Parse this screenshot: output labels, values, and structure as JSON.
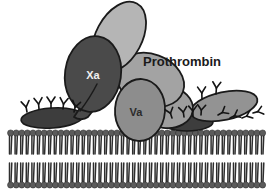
{
  "figure": {
    "background_color": "#ffffff",
    "width": 271,
    "height": 192
  },
  "labels": {
    "prothrombin": "Prothrombin",
    "factor_xa": "Xa",
    "factor_va": "Va"
  },
  "label_styles": {
    "prothrombin": {
      "color": "#1a1a1a",
      "font_size": 13,
      "x": 143,
      "y": 63
    },
    "factor_xa": {
      "color": "#f0f0f0",
      "font_size": 11,
      "x": 93,
      "y": 76
    },
    "factor_va": {
      "color": "#2b2b2b",
      "font_size": 11,
      "x": 136,
      "y": 113
    }
  },
  "colors": {
    "outline": "#1a1a1a",
    "factor_xa_fill": "#4a4a4a",
    "factor_va_fill": "#8d8d8d",
    "prothrombin_fill": "#9e9e9e",
    "prothrombin_top_fill": "#b5b5b5",
    "membrane_anchor_fill": "#3d3d3d",
    "right_protein_fill": "#939393",
    "lipid_head_fill": "#5b5b5b",
    "lipid_tail_stroke": "#2e2e2e",
    "gla_stroke": "#1a1a1a"
  },
  "shapes": {
    "prothrombin_top_lobe": {
      "cx": 118,
      "cy": 36,
      "rx": 23,
      "ry": 37,
      "rotate": 28
    },
    "prothrombin_mid_lobe": {
      "cx": 150,
      "cy": 82,
      "rx": 34,
      "ry": 26,
      "rotate": 22
    },
    "prothrombin_lower_lobe": {
      "cx": 165,
      "cy": 106,
      "rx": 26,
      "ry": 21,
      "rotate": 10
    },
    "factor_xa_body": {
      "cx": 93,
      "cy": 75,
      "rx": 28,
      "ry": 38,
      "rotate": 10
    },
    "factor_va_body": {
      "cx": 140,
      "cy": 110,
      "rx": 25,
      "ry": 31,
      "rotate": 5
    },
    "left_anchor_ellipse": {
      "cx": 52,
      "cy": 118,
      "rx": 31,
      "ry": 10,
      "rotate": -4
    },
    "right_anchor_ellipse": {
      "cx": 187,
      "cy": 122,
      "rx": 25,
      "ry": 9,
      "rotate": 0
    },
    "right_protein_ellipse": {
      "cx": 224,
      "cy": 106,
      "rx": 34,
      "ry": 14,
      "rotate": -12
    }
  },
  "membrane": {
    "label": "phospholipid bilayer",
    "top_leaflet_y": 132,
    "bottom_leaflet_y": 185,
    "leaflet_count": 2,
    "lipid_count_per_leaflet": 46,
    "x_start": 8,
    "x_end": 266,
    "head_radius": 3.1,
    "tail_length": 19
  },
  "gla_domains": {
    "description": "Y-shaped gamma-carboxyglutamate membrane-binding domains",
    "left_group": [
      {
        "x": 27,
        "y": 110,
        "rotate": -8
      },
      {
        "x": 39,
        "y": 107,
        "rotate": -4
      },
      {
        "x": 50,
        "y": 106,
        "rotate": 0
      },
      {
        "x": 61,
        "y": 107,
        "rotate": 5
      },
      {
        "x": 72,
        "y": 110,
        "rotate": 12
      }
    ],
    "right_group": [
      {
        "x": 186,
        "y": 116,
        "rotate": -14
      },
      {
        "x": 197,
        "y": 113,
        "rotate": -6
      },
      {
        "x": 205,
        "y": 112,
        "rotate": 0
      },
      {
        "x": 204,
        "y": 98,
        "rotate": 2
      },
      {
        "x": 216,
        "y": 92,
        "rotate": 6
      },
      {
        "x": 219,
        "y": 117,
        "rotate": 58
      },
      {
        "x": 231,
        "y": 119,
        "rotate": 62
      },
      {
        "x": 243,
        "y": 118,
        "rotate": 66
      },
      {
        "x": 253,
        "y": 113,
        "rotate": 72
      }
    ]
  }
}
